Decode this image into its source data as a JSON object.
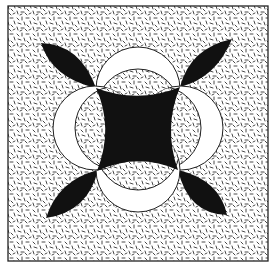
{
  "artwork": {
    "title": "Geometric quilt-style pattern",
    "colors": {
      "background": "#ffffff",
      "ink": "#111111",
      "speckle": "#333333"
    },
    "frame": {
      "x": 8,
      "y": 6,
      "width": 260,
      "height": 255
    },
    "center": {
      "x": 138,
      "y": 128
    },
    "circle_radius": 42,
    "inner_offset": 22,
    "circles": [
      {
        "name": "top",
        "cx": 138,
        "cy": 89,
        "dx": 0,
        "dy": 1
      },
      {
        "name": "right",
        "cx": 181,
        "cy": 128,
        "dx": -1,
        "dy": 0
      },
      {
        "name": "bottom",
        "cx": 138,
        "cy": 170,
        "dx": 0,
        "dy": -1
      },
      {
        "name": "left",
        "cx": 95,
        "cy": 128,
        "dx": 1,
        "dy": 0
      }
    ],
    "petals": [
      {
        "name": "top-left",
        "tip": [
          41,
          43
        ],
        "base": [
          95,
          87
        ]
      },
      {
        "name": "top-right",
        "tip": [
          231,
          39
        ],
        "base": [
          181,
          86
        ]
      },
      {
        "name": "bottom-right",
        "tip": [
          227,
          214
        ],
        "base": [
          179,
          170
        ]
      },
      {
        "name": "bottom-left",
        "tip": [
          47,
          217
        ],
        "base": [
          97,
          171
        ]
      }
    ]
  }
}
